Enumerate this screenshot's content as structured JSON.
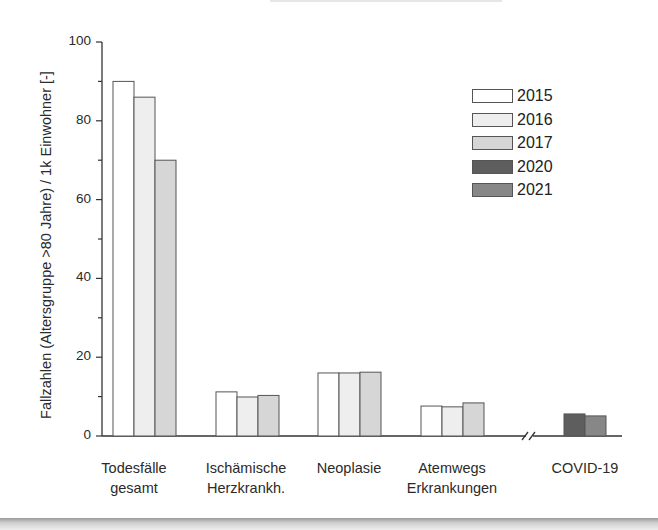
{
  "chart_data": {
    "type": "bar",
    "title": "",
    "xlabel": "",
    "ylabel": "Fallzahlen (Altersgruppe >80 Jahre) / 1k Einwohner [-]",
    "ylim": [
      0,
      100
    ],
    "yticks": [
      0,
      20,
      40,
      60,
      80,
      100
    ],
    "grid": false,
    "legend_position": "upper right",
    "axis_break": "between Atemwegs Erkrankungen and COVID-19",
    "categories": [
      "Todesfälle gesamt",
      "Ischämische Herzkrankh.",
      "Neoplasie",
      "Atemwegs Erkrankungen",
      "COVID-19"
    ],
    "category_lines": [
      [
        "Todesfälle",
        "gesamt"
      ],
      [
        "Ischämische",
        "Herzkrankh."
      ],
      [
        "Neoplasie"
      ],
      [
        "Atemwegs",
        "Erkrankungen"
      ],
      [
        "COVID-19"
      ]
    ],
    "series": [
      {
        "name": "2015",
        "color": "#ffffff",
        "values": [
          90.0,
          11.2,
          16.0,
          7.6,
          null
        ]
      },
      {
        "name": "2016",
        "color": "#eeeeee",
        "values": [
          86.0,
          9.9,
          16.0,
          7.4,
          null
        ]
      },
      {
        "name": "2017",
        "color": "#d6d6d6",
        "values": [
          70.0,
          10.3,
          16.2,
          8.4,
          null
        ]
      },
      {
        "name": "2020",
        "color": "#5e5e5e",
        "values": [
          null,
          null,
          null,
          null,
          5.6
        ]
      },
      {
        "name": "2021",
        "color": "#878787",
        "values": [
          null,
          null,
          null,
          null,
          5.1
        ]
      }
    ]
  }
}
